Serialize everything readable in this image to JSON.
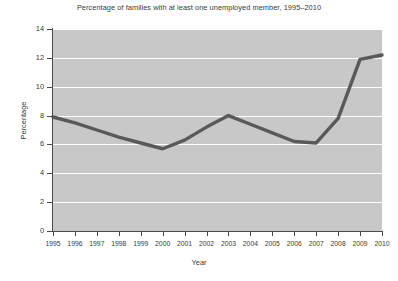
{
  "chart_data": {
    "type": "line",
    "title": "Percentage of families with at least one unemployed member, 1995–2010",
    "xlabel": "Year",
    "ylabel": "Percentage",
    "grid": true,
    "legend": "none",
    "categories": [
      1995,
      1996,
      1997,
      1998,
      1999,
      2000,
      2001,
      2002,
      2003,
      2004,
      2005,
      2006,
      2007,
      2008,
      2009,
      2010
    ],
    "tick_labels_x": [
      "1995",
      "1996",
      "1997",
      "1998",
      "1999",
      "2000",
      "2001",
      "2002",
      "2003",
      "2004",
      "2005",
      "2006",
      "2007",
      "2008",
      "2009",
      "2010"
    ],
    "tick_labels_y": [
      "0",
      "2",
      "4",
      "6",
      "8",
      "10",
      "12",
      "14"
    ],
    "ticks_y": [
      0,
      2,
      4,
      6,
      8,
      10,
      12,
      14
    ],
    "ylim": [
      0,
      14
    ],
    "xlim": [
      1995,
      2010
    ],
    "series": [
      {
        "name": "Families with at least one unemployed member",
        "color": "#595959",
        "values": [
          7.9,
          7.5,
          7.0,
          6.5,
          6.1,
          5.7,
          6.3,
          7.2,
          8.0,
          7.4,
          6.8,
          6.2,
          6.1,
          7.8,
          11.9,
          12.2
        ]
      }
    ],
    "plot_background": "#c8c8c8",
    "gridline_color": "#ffffff",
    "axis_color": "#4a4a4a",
    "figure_background": "#ffffff"
  }
}
